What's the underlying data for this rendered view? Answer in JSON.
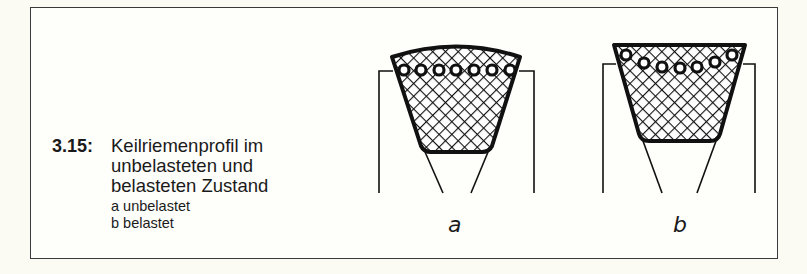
{
  "figure": {
    "number": "3.15:",
    "title_lines": [
      "Keilriemenprofil im",
      "unbelasteten und",
      "belasteten Zustand"
    ],
    "legend": [
      "a unbelastet",
      "b belastet"
    ],
    "panels": [
      {
        "label": "a",
        "state": "unbelastet"
      },
      {
        "label": "b",
        "state": "belastet"
      }
    ]
  }
}
